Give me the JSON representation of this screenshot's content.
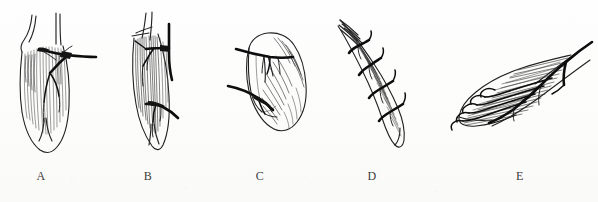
{
  "figure": {
    "background_color": "#fdfdfc",
    "ink_color": "#1a1a1a",
    "caption_color": "#3c3c3c",
    "panel_count": 5
  },
  "panels": [
    {
      "id": "a",
      "label": "A",
      "subject": "fusiform-muscle-with-single-nerve-entry",
      "description": "Elongated spindle-shaped muscle, tendon strands at top, tapering rounded belly at bottom; a stout nerve trunk enters from the right at upper third and fans into descending branches."
    },
    {
      "id": "b",
      "label": "B",
      "subject": "elongated-muscle-with-two-nerve-entries",
      "description": "Narrow elongated muscle with long tendon strands at top and a pointed tip; two separate nerve trunks enter from the right, one at the upper third and one near the lower third."
    },
    {
      "id": "c",
      "label": "C",
      "subject": "broad-flat-muscle-with-two-nerve-entries",
      "description": "Short broad leaf-shaped muscle tilted to the right with heavy oblique shading; two stout nerve trunks enter horizontally from the left side."
    },
    {
      "id": "d",
      "label": "D",
      "subject": "curved-slender-muscle-with-segmental-nerves",
      "description": "Long curved slender muscle running from upper left to lower right with frayed tendon fibres at its upper end; four short hooked nerve branches enter along its upper border."
    },
    {
      "id": "e",
      "label": "E",
      "subject": "fan-shaped-pennate-muscle",
      "description": "Triangular fan-shaped pennate muscle with dense oblique fibres; a single thick nerve trunk enters from the upper right along the tendon and divides into branches that reach the free left margin."
    }
  ],
  "captions": {
    "a": "A",
    "b": "B",
    "c": "C",
    "d": "D",
    "e": "E"
  }
}
